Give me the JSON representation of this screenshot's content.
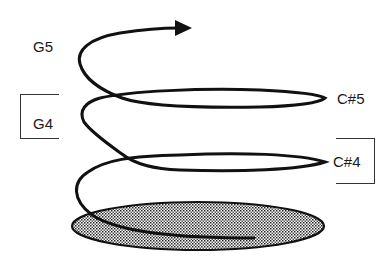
{
  "diagram": {
    "type": "pitch-helix",
    "labels": {
      "g5": "G5",
      "g4": "G4",
      "cs5": "C#5",
      "cs4": "C#4"
    },
    "colors": {
      "stroke": "#111111",
      "text": "#1a1a1a",
      "shade": "#bdbdbd",
      "background": "#ffffff"
    },
    "brackets": [
      {
        "around": "G4",
        "side": "left"
      },
      {
        "around": "C#4",
        "side": "right"
      }
    ],
    "arrow": {
      "direction": "right",
      "meaning": "increasing pitch"
    }
  }
}
